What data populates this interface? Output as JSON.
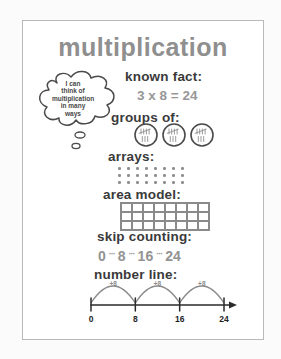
{
  "poster": {
    "title": "multiplication",
    "thought_bubble": {
      "lines": [
        "I can",
        "think of",
        "multiplication",
        "in many",
        "ways"
      ]
    },
    "known_fact": {
      "label": "known fact:",
      "value": "3 x 8 = 24"
    },
    "groups_of": {
      "label": "groups of:",
      "group_count": 3,
      "per_group": 8
    },
    "arrays": {
      "label": "arrays:",
      "rows": 3,
      "cols": 8
    },
    "area_model": {
      "label": "area model:",
      "rows": 3,
      "cols": 8
    },
    "skip_counting": {
      "label": "skip counting:",
      "values": [
        "0",
        "8",
        "16",
        "24"
      ],
      "separator": "···"
    },
    "number_line": {
      "label": "number line:",
      "ticks": [
        "0",
        "8",
        "16",
        "24"
      ],
      "jump_label": "+8",
      "jump_count": 3
    },
    "colors": {
      "ink_dark": "#3a3a3a",
      "ink_gray": "#979797",
      "line_black": "#2b2b2b",
      "sheet_border": "#b9b9b9"
    }
  }
}
